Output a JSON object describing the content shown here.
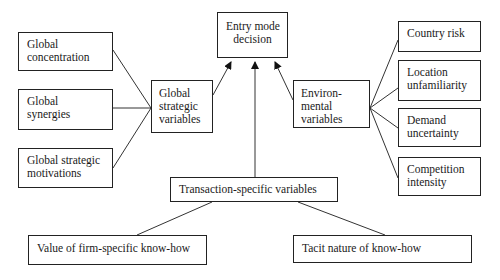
{
  "diagram": {
    "central": {
      "lines": [
        "Entry mode",
        "decision"
      ]
    },
    "global_strategic": {
      "group": {
        "lines": [
          "Global",
          "strategic",
          "variables"
        ]
      },
      "factors": [
        {
          "lines": [
            "Global",
            "concentration"
          ]
        },
        {
          "lines": [
            "Global",
            "synergies"
          ]
        },
        {
          "lines": [
            "Global strategic",
            "motivations"
          ]
        }
      ]
    },
    "environmental": {
      "group": {
        "lines": [
          "Environ-",
          "mental",
          "variables"
        ]
      },
      "factors": [
        {
          "lines": [
            "Country risk"
          ]
        },
        {
          "lines": [
            "Location",
            "unfamiliarity"
          ]
        },
        {
          "lines": [
            "Demand",
            "uncertainty"
          ]
        },
        {
          "lines": [
            "Competition",
            "intensity"
          ]
        }
      ]
    },
    "transaction_specific": {
      "group": {
        "lines": [
          "Transaction-specific variables"
        ]
      },
      "factors": [
        {
          "lines": [
            "Value of firm-specific know-how"
          ]
        },
        {
          "lines": [
            "Tacit nature of know-how"
          ]
        }
      ]
    },
    "colors": {
      "line": "#222222",
      "box_border": "#222222",
      "text": "#1a1a1a",
      "background": "#ffffff"
    }
  }
}
